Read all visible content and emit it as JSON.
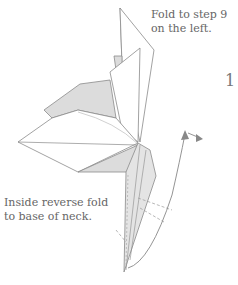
{
  "diagram": {
    "type": "origami-instruction",
    "step_number": "1",
    "annotations": {
      "top_line1": "Fold to step 9",
      "top_line2": "on the left.",
      "bottom_line1": "Inside reverse fold",
      "bottom_line2": "to base of neck."
    },
    "colors": {
      "line": "#8a8a8a",
      "shade": "#dcdcdc",
      "arrow": "#888888",
      "text": "#666666"
    }
  }
}
